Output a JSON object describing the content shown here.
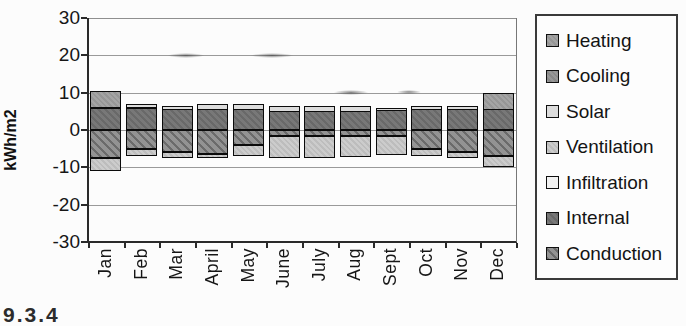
{
  "page": {
    "caption": "9.3.4"
  },
  "chart_data": {
    "type": "bar",
    "stacked": true,
    "title": "",
    "xlabel": "",
    "ylabel": "kWh/m2",
    "categories": [
      "Jan",
      "Feb",
      "Mar",
      "April",
      "May",
      "June",
      "July",
      "Aug",
      "Sept",
      "Oct",
      "Nov",
      "Dec"
    ],
    "ylim": [
      -30,
      30
    ],
    "yticks": [
      30,
      20,
      10,
      0,
      -10,
      -20,
      -30
    ],
    "grid": true,
    "legend_position": "right",
    "series": [
      {
        "key": "heating",
        "name": "Heating",
        "color": "#9c9c9c",
        "values": [
          4.5,
          0,
          0,
          0,
          0,
          0,
          0,
          0,
          0,
          0,
          0,
          4.5
        ]
      },
      {
        "key": "cooling",
        "name": "Cooling",
        "color": "#8f8f8f",
        "values": [
          0,
          0,
          0,
          0,
          0,
          0,
          0,
          0,
          0,
          0,
          0,
          0
        ]
      },
      {
        "key": "solar",
        "name": "Solar",
        "color": "#dcdcdc",
        "values": [
          0,
          1,
          1,
          1.5,
          1.5,
          1.5,
          1.5,
          1.5,
          0.5,
          1,
          1,
          0
        ]
      },
      {
        "key": "ventilation",
        "name": "Ventilation",
        "color": "#c4c4c4",
        "values": [
          -3.5,
          -2,
          -1.5,
          -1,
          -3,
          -6,
          -6,
          -5.5,
          -5,
          -2,
          -1.5,
          -3
        ]
      },
      {
        "key": "infiltration",
        "name": "Infiltration",
        "color": "#f2f2f2",
        "values": [
          0,
          0,
          0,
          0,
          0,
          0,
          0,
          0,
          0,
          0,
          0,
          0
        ]
      },
      {
        "key": "internal",
        "name": "Internal",
        "color": "#6e6e6e",
        "values": [
          6,
          6,
          5.5,
          5.5,
          5.5,
          5,
          5,
          5,
          5.5,
          5.5,
          5.5,
          5.5
        ]
      },
      {
        "key": "conduction",
        "name": "Conduction",
        "color": "#858585",
        "values": [
          -7.5,
          -5,
          -6,
          -6.5,
          -4,
          -1.5,
          -1.5,
          -1.5,
          -1.5,
          -5,
          -6,
          -7
        ]
      }
    ],
    "stack_order_positive": [
      "internal",
      "solar",
      "heating"
    ],
    "stack_order_negative": [
      "conduction",
      "cooling",
      "ventilation"
    ]
  }
}
